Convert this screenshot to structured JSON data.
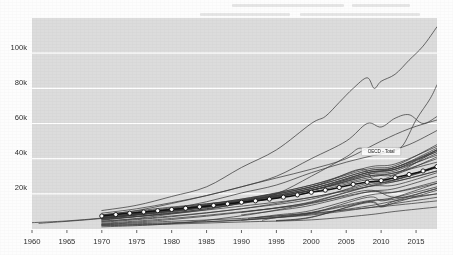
{
  "chart_data": {
    "type": "line",
    "title": "",
    "subtitle": "",
    "xlabel": "",
    "ylabel": "",
    "xlim": [
      1960,
      2018
    ],
    "ylim": [
      0,
      120000
    ],
    "grid": true,
    "grid_axis": "y",
    "legend_position": "inline-right",
    "plot_background": "#dcdcdc",
    "gridline_color": "#ffffff",
    "line_color": "#3a3a3a",
    "highlight_color": "#111111",
    "x_ticks": [
      1960,
      1965,
      1970,
      1975,
      1980,
      1985,
      1990,
      1995,
      2000,
      2005,
      2010,
      2015
    ],
    "x_tick_labels": [
      "1960",
      "1965",
      "1970",
      "1975",
      "1980",
      "1985",
      "1990",
      "1995",
      "2000",
      "2005",
      "2010",
      "2015"
    ],
    "y_ticks": [
      20000,
      40000,
      60000,
      80000,
      100000
    ],
    "y_tick_labels": [
      "20k",
      "40k",
      "60k",
      "80k",
      "100k"
    ],
    "annotations": [
      {
        "name": "oecd-total-label",
        "text": "OECD - Total",
        "x": 2010,
        "y": 44000
      }
    ],
    "highlight_series": "OECD - Total",
    "series": [
      {
        "name": "OECD - Total",
        "marker": "circle",
        "highlight": true,
        "x": [
          1970,
          1972,
          1974,
          1976,
          1978,
          1980,
          1982,
          1984,
          1986,
          1988,
          1990,
          1992,
          1994,
          1996,
          1998,
          2000,
          2002,
          2004,
          2006,
          2008,
          2010,
          2012,
          2014,
          2016,
          2018
        ],
        "values": [
          7400,
          8200,
          9000,
          9700,
          10400,
          11100,
          11800,
          12600,
          13400,
          14300,
          15200,
          16000,
          17000,
          18100,
          19400,
          20900,
          22100,
          23600,
          25400,
          26600,
          27500,
          29200,
          31000,
          33000,
          35500
        ]
      },
      {
        "name": "Luxembourg",
        "marker": "none",
        "highlight": false,
        "x": [
          1970,
          1975,
          1980,
          1985,
          1990,
          1995,
          2000,
          2002,
          2004,
          2006,
          2008,
          2009,
          2010,
          2012,
          2014,
          2016,
          2018
        ],
        "values": [
          10500,
          13500,
          18500,
          24000,
          35000,
          45000,
          60000,
          64000,
          72000,
          80000,
          86000,
          80000,
          84000,
          88000,
          96000,
          104000,
          115000
        ]
      },
      {
        "name": "Ireland",
        "marker": "none",
        "highlight": false,
        "x": [
          1970,
          1975,
          1980,
          1985,
          1990,
          1995,
          2000,
          2005,
          2007,
          2009,
          2011,
          2013,
          2015,
          2017,
          2018
        ],
        "values": [
          4500,
          6000,
          8500,
          11000,
          15000,
          20000,
          30000,
          41000,
          46000,
          42000,
          44000,
          47000,
          62000,
          74000,
          82000
        ]
      },
      {
        "name": "Norway",
        "marker": "none",
        "highlight": false,
        "x": [
          1970,
          1975,
          1980,
          1985,
          1990,
          1995,
          2000,
          2005,
          2008,
          2010,
          2012,
          2014,
          2016,
          2018
        ],
        "values": [
          8000,
          10500,
          14500,
          19000,
          24000,
          30000,
          40000,
          50000,
          60000,
          58000,
          63000,
          65000,
          60000,
          64000
        ]
      },
      {
        "name": "Switzerland",
        "marker": "none",
        "highlight": false,
        "x": [
          1970,
          1975,
          1980,
          1985,
          1990,
          1995,
          2000,
          2005,
          2010,
          2014,
          2018
        ],
        "values": [
          9000,
          11500,
          15000,
          19000,
          24000,
          29000,
          34000,
          40000,
          50000,
          57000,
          62000
        ]
      },
      {
        "name": "United States",
        "marker": "none",
        "highlight": false,
        "x": [
          1960,
          1965,
          1970,
          1975,
          1980,
          1985,
          1990,
          1995,
          2000,
          2005,
          2010,
          2014,
          2018
        ],
        "values": [
          3600,
          4600,
          6200,
          8200,
          11500,
          15500,
          20500,
          25000,
          32000,
          38000,
          43000,
          48000,
          56000
        ]
      },
      {
        "name": "Netherlands",
        "marker": "none",
        "highlight": false,
        "x": [
          1970,
          1980,
          1990,
          2000,
          2008,
          2012,
          2018
        ],
        "values": [
          7200,
          11500,
          16500,
          25000,
          34000,
          36000,
          48000
        ]
      },
      {
        "name": "Austria",
        "marker": "none",
        "highlight": false,
        "x": [
          1970,
          1980,
          1990,
          2000,
          2008,
          2012,
          2018
        ],
        "values": [
          6600,
          11000,
          16000,
          24000,
          33000,
          35000,
          46000
        ]
      },
      {
        "name": "Denmark",
        "marker": "none",
        "highlight": false,
        "x": [
          1970,
          1980,
          1990,
          2000,
          2008,
          2012,
          2018
        ],
        "values": [
          7600,
          12000,
          17000,
          25000,
          35000,
          37000,
          47000
        ]
      },
      {
        "name": "Sweden",
        "marker": "none",
        "highlight": false,
        "x": [
          1970,
          1980,
          1990,
          2000,
          2008,
          2012,
          2018
        ],
        "values": [
          8000,
          12500,
          16500,
          24000,
          33000,
          35000,
          45000
        ]
      },
      {
        "name": "Germany",
        "marker": "none",
        "highlight": false,
        "x": [
          1970,
          1980,
          1991,
          2000,
          2008,
          2012,
          2018
        ],
        "values": [
          6800,
          11000,
          16500,
          23000,
          32000,
          34000,
          45000
        ]
      },
      {
        "name": "Belgium",
        "marker": "none",
        "highlight": false,
        "x": [
          1970,
          1980,
          1990,
          2000,
          2008,
          2012,
          2018
        ],
        "values": [
          6400,
          10500,
          15500,
          23000,
          32000,
          34000,
          44000
        ]
      },
      {
        "name": "Australia",
        "marker": "none",
        "highlight": false,
        "x": [
          1970,
          1980,
          1990,
          2000,
          2008,
          2012,
          2018
        ],
        "values": [
          6200,
          10000,
          15000,
          22000,
          31000,
          35000,
          44000
        ]
      },
      {
        "name": "Canada",
        "marker": "none",
        "highlight": false,
        "x": [
          1961,
          1970,
          1980,
          1990,
          2000,
          2008,
          2012,
          2018
        ],
        "values": [
          3200,
          6000,
          10500,
          16000,
          23000,
          31000,
          33000,
          43000
        ]
      },
      {
        "name": "Iceland",
        "marker": "none",
        "highlight": false,
        "x": [
          1970,
          1980,
          1990,
          2000,
          2007,
          2009,
          2012,
          2018
        ],
        "values": [
          6000,
          11000,
          17000,
          24000,
          34000,
          28000,
          31000,
          45000
        ]
      },
      {
        "name": "Finland",
        "marker": "none",
        "highlight": false,
        "x": [
          1970,
          1980,
          1990,
          2000,
          2008,
          2012,
          2018
        ],
        "values": [
          6000,
          10000,
          16000,
          22000,
          32000,
          34000,
          42000
        ]
      },
      {
        "name": "United Kingdom",
        "marker": "none",
        "highlight": false,
        "x": [
          1970,
          1980,
          1990,
          2000,
          2008,
          2012,
          2018
        ],
        "values": [
          5500,
          9000,
          14500,
          22000,
          30000,
          31000,
          41000
        ]
      },
      {
        "name": "France",
        "marker": "none",
        "highlight": false,
        "x": [
          1970,
          1980,
          1990,
          2000,
          2008,
          2012,
          2018
        ],
        "values": [
          6200,
          10200,
          15000,
          22000,
          30000,
          32000,
          40000
        ]
      },
      {
        "name": "Japan",
        "marker": "none",
        "highlight": false,
        "x": [
          1970,
          1980,
          1990,
          2000,
          2008,
          2012,
          2018
        ],
        "values": [
          5000,
          9500,
          15500,
          22000,
          29000,
          32000,
          38000
        ]
      },
      {
        "name": "Italy",
        "marker": "none",
        "highlight": false,
        "x": [
          1970,
          1980,
          1990,
          2000,
          2008,
          2012,
          2018
        ],
        "values": [
          5200,
          9000,
          14500,
          21000,
          28000,
          28000,
          35000
        ]
      },
      {
        "name": "New Zealand",
        "marker": "none",
        "highlight": false,
        "x": [
          1970,
          1980,
          1990,
          2000,
          2008,
          2012,
          2018
        ],
        "values": [
          5600,
          8800,
          13000,
          18000,
          25000,
          28000,
          36000
        ]
      },
      {
        "name": "Spain",
        "marker": "none",
        "highlight": false,
        "x": [
          1970,
          1980,
          1990,
          2000,
          2008,
          2012,
          2018
        ],
        "values": [
          3800,
          7000,
          11500,
          17000,
          26000,
          27000,
          33000
        ]
      },
      {
        "name": "Israel",
        "marker": "none",
        "highlight": false,
        "x": [
          1970,
          1980,
          1990,
          2000,
          2008,
          2012,
          2018
        ],
        "values": [
          4200,
          7400,
          11500,
          18000,
          24000,
          27000,
          33000
        ]
      },
      {
        "name": "Korea",
        "marker": "none",
        "highlight": false,
        "x": [
          1970,
          1980,
          1990,
          1998,
          2000,
          2008,
          2012,
          2018
        ],
        "values": [
          1200,
          3000,
          7500,
          13000,
          15000,
          24000,
          28000,
          35000
        ]
      },
      {
        "name": "Slovenia",
        "marker": "none",
        "highlight": false,
        "x": [
          1990,
          1995,
          2000,
          2008,
          2012,
          2018
        ],
        "values": [
          9500,
          12000,
          15500,
          24000,
          25000,
          32000
        ]
      },
      {
        "name": "Czech Republic",
        "marker": "none",
        "highlight": false,
        "x": [
          1990,
          1995,
          2000,
          2008,
          2012,
          2018
        ],
        "values": [
          8000,
          10500,
          13500,
          21000,
          23000,
          30000
        ]
      },
      {
        "name": "Portugal",
        "marker": "none",
        "highlight": false,
        "x": [
          1970,
          1980,
          1990,
          2000,
          2008,
          2012,
          2018
        ],
        "values": [
          2800,
          5400,
          9500,
          15000,
          21000,
          21000,
          26000
        ]
      },
      {
        "name": "Slovak Republic",
        "marker": "none",
        "highlight": false,
        "x": [
          1992,
          1995,
          2000,
          2008,
          2012,
          2018
        ],
        "values": [
          6500,
          8000,
          10500,
          19000,
          21000,
          27000
        ]
      },
      {
        "name": "Estonia",
        "marker": "none",
        "highlight": false,
        "x": [
          1993,
          1995,
          2000,
          2008,
          2010,
          2012,
          2018
        ],
        "values": [
          5000,
          6500,
          9000,
          18000,
          16000,
          18000,
          26000
        ]
      },
      {
        "name": "Greece",
        "marker": "none",
        "highlight": false,
        "x": [
          1970,
          1980,
          1990,
          2000,
          2008,
          2012,
          2018
        ],
        "values": [
          3200,
          6000,
          9800,
          14500,
          22000,
          18000,
          20000
        ]
      },
      {
        "name": "Poland",
        "marker": "none",
        "highlight": false,
        "x": [
          1990,
          1995,
          2000,
          2008,
          2012,
          2018
        ],
        "values": [
          5000,
          6800,
          9200,
          15500,
          18000,
          24000
        ]
      },
      {
        "name": "Hungary",
        "marker": "none",
        "highlight": false,
        "x": [
          1991,
          1995,
          2000,
          2008,
          2012,
          2018
        ],
        "values": [
          6000,
          7500,
          9500,
          16000,
          17000,
          23000
        ]
      },
      {
        "name": "Latvia",
        "marker": "none",
        "highlight": false,
        "x": [
          1995,
          2000,
          2008,
          2010,
          2012,
          2018
        ],
        "values": [
          4800,
          6800,
          15000,
          12500,
          15000,
          22000
        ]
      },
      {
        "name": "Lithuania",
        "marker": "none",
        "highlight": false,
        "x": [
          1995,
          2000,
          2008,
          2010,
          2012,
          2018
        ],
        "values": [
          4600,
          6600,
          15500,
          13000,
          16000,
          23000
        ]
      },
      {
        "name": "Chile",
        "marker": "none",
        "highlight": false,
        "x": [
          1970,
          1980,
          1990,
          2000,
          2008,
          2012,
          2018
        ],
        "values": [
          2400,
          3600,
          5000,
          8500,
          13000,
          16000,
          20000
        ]
      },
      {
        "name": "Turkey",
        "marker": "none",
        "highlight": false,
        "x": [
          1970,
          1980,
          1990,
          2000,
          2008,
          2012,
          2018
        ],
        "values": [
          2000,
          3200,
          5200,
          8000,
          12000,
          14500,
          18000
        ]
      },
      {
        "name": "Mexico",
        "marker": "none",
        "highlight": false,
        "x": [
          1970,
          1980,
          1990,
          2000,
          2008,
          2012,
          2018
        ],
        "values": [
          2600,
          4400,
          6000,
          9000,
          12000,
          13500,
          16000
        ]
      },
      {
        "name": "Colombia",
        "marker": "none",
        "highlight": false,
        "x": [
          1970,
          1980,
          1990,
          2000,
          2008,
          2012,
          2018
        ],
        "values": [
          1800,
          2800,
          4000,
          5200,
          8000,
          10000,
          12500
        ]
      }
    ]
  }
}
